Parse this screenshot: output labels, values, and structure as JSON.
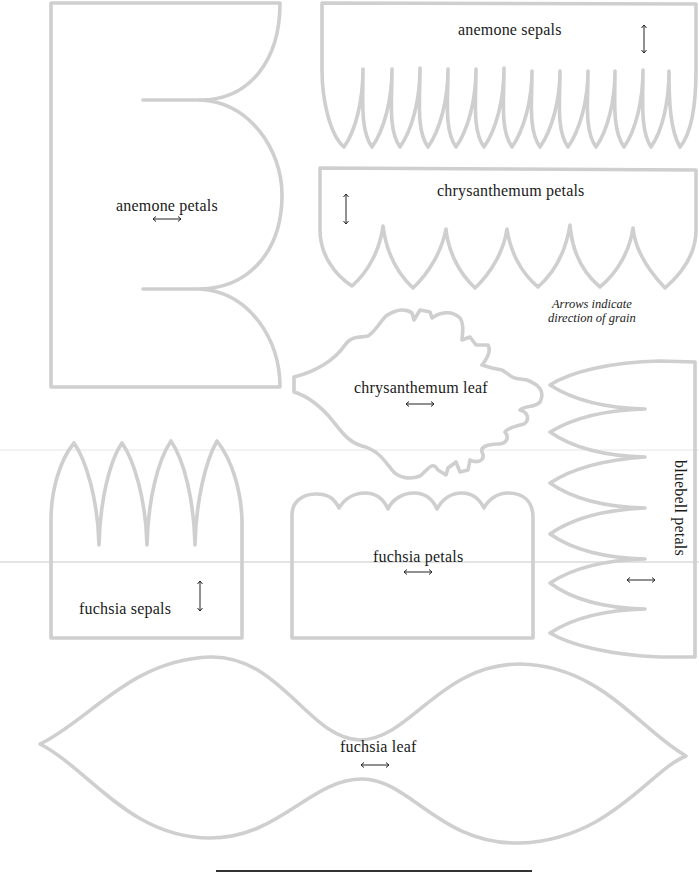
{
  "note": {
    "line1": "Arrows indicate",
    "line2": "direction of grain"
  },
  "stroke_color": "#cfcfcf",
  "text_color": "#1a1a1a",
  "templates": {
    "anemone_petals": {
      "label": "anemone petals",
      "grain": "horizontal"
    },
    "anemone_sepals": {
      "label": "anemone sepals",
      "grain": "vertical"
    },
    "chrysanthemum_petals": {
      "label": "chrysanthemum petals",
      "grain": "vertical"
    },
    "chrysanthemum_leaf": {
      "label": "chrysanthemum leaf",
      "grain": "horizontal"
    },
    "bluebell_petals": {
      "label": "bluebell petals",
      "grain": "horizontal"
    },
    "fuchsia_sepals": {
      "label": "fuchsia sepals",
      "grain": "vertical"
    },
    "fuchsia_petals": {
      "label": "fuchsia petals",
      "grain": "horizontal"
    },
    "fuchsia_leaf": {
      "label": "fuchsia leaf",
      "grain": "horizontal"
    }
  },
  "icons": {
    "grain_horizontal": "double-arrow-horizontal-icon",
    "grain_vertical": "double-arrow-vertical-icon"
  }
}
